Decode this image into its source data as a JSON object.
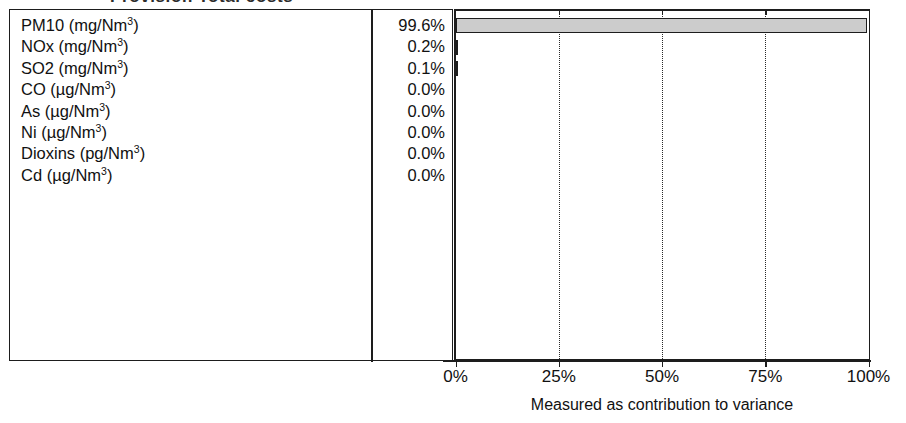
{
  "title": {
    "text": "Provision Total costs",
    "clipped": true
  },
  "chart_data": {
    "type": "bar",
    "orientation": "horizontal",
    "title": "Provision Total costs",
    "xlabel": "Measured as contribution to variance",
    "ylabel": "",
    "xlim": [
      0,
      100
    ],
    "xticks": [
      "0%",
      "25%",
      "50%",
      "75%",
      "100%"
    ],
    "xtick_values": [
      0,
      25,
      50,
      75,
      100
    ],
    "grid": "vertical-dotted",
    "legend": "none",
    "bar_fill_color": "#cccccc",
    "bar_border_color": "#1d1d1d",
    "categories": [
      "PM10 (mg/Nm3)",
      "NOx (mg/Nm3)",
      "SO2 (mg/Nm3)",
      "CO (µg/Nm3)",
      "As (µg/Nm3)",
      "Ni (µg/Nm3)",
      "Dioxins (pg/Nm3)",
      "Cd (µg/Nm3)"
    ],
    "values": [
      99.6,
      0.2,
      0.1,
      0.0,
      0.0,
      0.0,
      0.0,
      0.0
    ],
    "value_labels": [
      "99.6%",
      "0.2%",
      "0.1%",
      "0.0%",
      "0.0%",
      "0.0%",
      "0.0%",
      "0.0%"
    ]
  },
  "table": {
    "rows": [
      {
        "name": "PM10",
        "unit_prefix": "mg",
        "label_base": "PM10 (mg/Nm",
        "sup": "3",
        "label_suffix": ")",
        "value": "99.6%",
        "bar_pct": 99.6
      },
      {
        "name": "NOx",
        "unit_prefix": "mg",
        "label_base": "NOx (mg/Nm",
        "sup": "3",
        "label_suffix": ")",
        "value": "0.2%",
        "bar_pct": 0.2
      },
      {
        "name": "SO2",
        "unit_prefix": "mg",
        "label_base": "SO2 (mg/Nm",
        "sup": "3",
        "label_suffix": ")",
        "value": "0.1%",
        "bar_pct": 0.1
      },
      {
        "name": "CO",
        "unit_prefix": "µg",
        "label_base": "CO (µg/Nm",
        "sup": "3",
        "label_suffix": ")",
        "value": "0.0%",
        "bar_pct": 0.0
      },
      {
        "name": "As",
        "unit_prefix": "µg",
        "label_base": "As (µg/Nm",
        "sup": "3",
        "label_suffix": ")",
        "value": "0.0%",
        "bar_pct": 0.0
      },
      {
        "name": "Ni",
        "unit_prefix": "µg",
        "label_base": "Ni (µg/Nm",
        "sup": "3",
        "label_suffix": ")",
        "value": "0.0%",
        "bar_pct": 0.0
      },
      {
        "name": "Dioxins",
        "unit_prefix": "pg",
        "label_base": "Dioxins (pg/Nm",
        "sup": "3",
        "label_suffix": ")",
        "value": "0.0%",
        "bar_pct": 0.0
      },
      {
        "name": "Cd",
        "unit_prefix": "µg",
        "label_base": "Cd (µg/Nm",
        "sup": "3",
        "label_suffix": ")",
        "value": "0.0%",
        "bar_pct": 0.0
      }
    ]
  },
  "axis": {
    "caption": "Measured as contribution to variance",
    "ticks": [
      "0%",
      "25%",
      "50%",
      "75%",
      "100%"
    ]
  },
  "colors": {
    "bar_fill": "#cccccc",
    "line": "#1d1d1d",
    "text": "#111111",
    "background": "#ffffff"
  }
}
